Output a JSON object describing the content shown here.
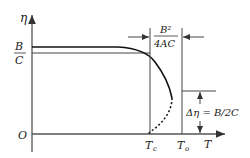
{
  "diagram": {
    "axes": {
      "y_label": "η",
      "x_label": "T",
      "origin_label": "O"
    },
    "y_tick": {
      "numerator": "B",
      "denominator": "C"
    },
    "x_ticks": [
      {
        "main": "T",
        "sub": "c"
      },
      {
        "main": "T",
        "sub": "o"
      }
    ],
    "width_annotation": {
      "numerator": "B²",
      "denominator": "4AC"
    },
    "jump_annotation": "Δη = B/2C",
    "curves": [
      {
        "name": "solid-upper-branch",
        "style": "solid"
      },
      {
        "name": "dashed-lower-branch",
        "style": "dashed"
      },
      {
        "name": "reference-level-B-over-C",
        "style": "solid-thin"
      }
    ]
  }
}
